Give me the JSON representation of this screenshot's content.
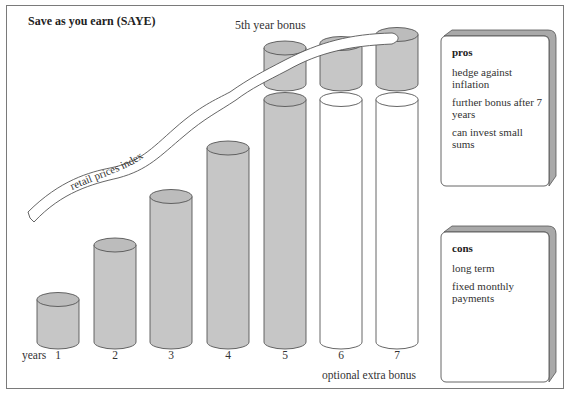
{
  "title": "Save as you earn (SAYE)",
  "annotations": {
    "bonus_label": "5th year bonus",
    "ribbon_label": "retail prices index",
    "years_label": "years",
    "extra_bonus_label": "optional extra bonus"
  },
  "colors": {
    "cylinder_fill": "#c6c6c6",
    "cylinder_top": "#bcbcbc",
    "optional_fill": "#ffffff",
    "outline": "#555555",
    "card_side": "#a9a9a9"
  },
  "chart_data": {
    "type": "bar",
    "title": "Save as you earn (SAYE)",
    "xlabel": "years",
    "categories": [
      "1",
      "2",
      "3",
      "4",
      "5",
      "6",
      "7"
    ],
    "series": [
      {
        "name": "savings",
        "values": [
          1,
          2,
          3,
          4,
          5,
          5,
          5
        ],
        "style": [
          "filled",
          "filled",
          "filled",
          "filled",
          "filled",
          "optional",
          "optional"
        ]
      },
      {
        "name": "bonus",
        "values": [
          0,
          0,
          0,
          0,
          0.8,
          0.9,
          1.1
        ]
      }
    ],
    "annotations": [
      "5th year bonus",
      "retail prices index",
      "optional extra bonus"
    ]
  },
  "pros": {
    "heading": "pros",
    "items": [
      "hedge against inflation",
      "further bonus after 7 years",
      "can invest small sums"
    ]
  },
  "cons": {
    "heading": "cons",
    "items": [
      "long term",
      "fixed monthly payments"
    ]
  }
}
